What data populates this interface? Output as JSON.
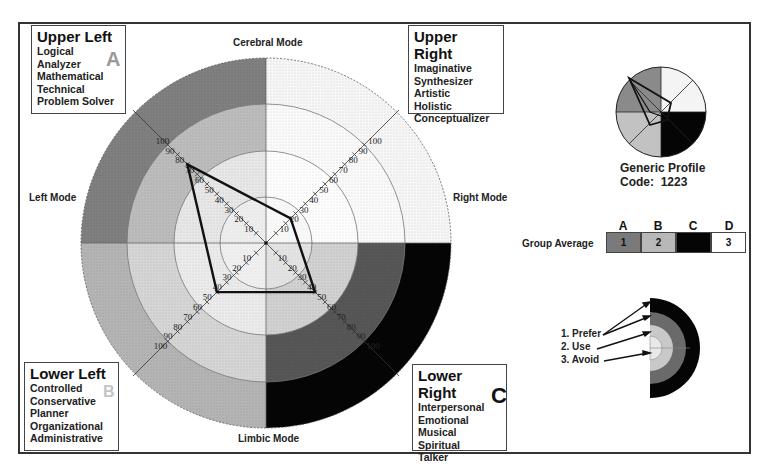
{
  "quadrants": {
    "upper_left": {
      "title": "Upper Left",
      "letter": "A",
      "items": [
        "Logical",
        "Analyzer",
        "Mathematical",
        "Technical",
        "Problem Solver"
      ]
    },
    "upper_right": {
      "title": "Upper Right",
      "letter": "D",
      "items": [
        "Imaginative",
        "Synthesizer",
        "Artistic",
        "Holistic",
        "Conceptualizer"
      ]
    },
    "lower_left": {
      "title": "Lower Left",
      "letter": "B",
      "items": [
        "Controlled",
        "Conservative",
        "Planner",
        "Organizational",
        "Administrative"
      ]
    },
    "lower_right": {
      "title": "Lower Right",
      "letter": "C",
      "items": [
        "Interpersonal",
        "Emotional",
        "Musical",
        "Spiritual",
        "Talker"
      ]
    }
  },
  "modes": {
    "top": "Cerebral Mode",
    "bottom": "Limbic Mode",
    "left": "Left Mode",
    "right": "Right Mode"
  },
  "generic_profile": {
    "title": "Generic Profile",
    "code_label": "Code:",
    "code": "1223"
  },
  "group_average": {
    "label": "Group Average",
    "columns": [
      {
        "header": "A",
        "value": "1",
        "color": "#7a7a7a"
      },
      {
        "header": "B",
        "value": "2",
        "color": "#b8b8b8"
      },
      {
        "header": "C",
        "value": "",
        "color": "#050505"
      },
      {
        "header": "D",
        "value": "3",
        "color": "#ffffff"
      }
    ]
  },
  "legend": {
    "items": [
      "1. Prefer",
      "2. Use",
      "3. Avoid"
    ]
  },
  "chart_data": {
    "type": "radar",
    "axes": [
      "A (Upper Left)",
      "D (Upper Right)",
      "C (Lower Right)",
      "B (Lower Left)"
    ],
    "values": [
      80,
      25,
      50,
      50
    ],
    "axis_ticks": [
      10,
      20,
      30,
      40,
      50,
      60,
      70,
      80,
      90,
      100
    ],
    "ring_boundaries": [
      33,
      67,
      100,
      133
    ],
    "quadrant_colors": {
      "A": "#7a7a7a",
      "B": "#b8b8b8",
      "C": "#050505",
      "D": "#ffffff"
    },
    "preference_levels": [
      "Prefer",
      "Use",
      "Avoid"
    ]
  }
}
